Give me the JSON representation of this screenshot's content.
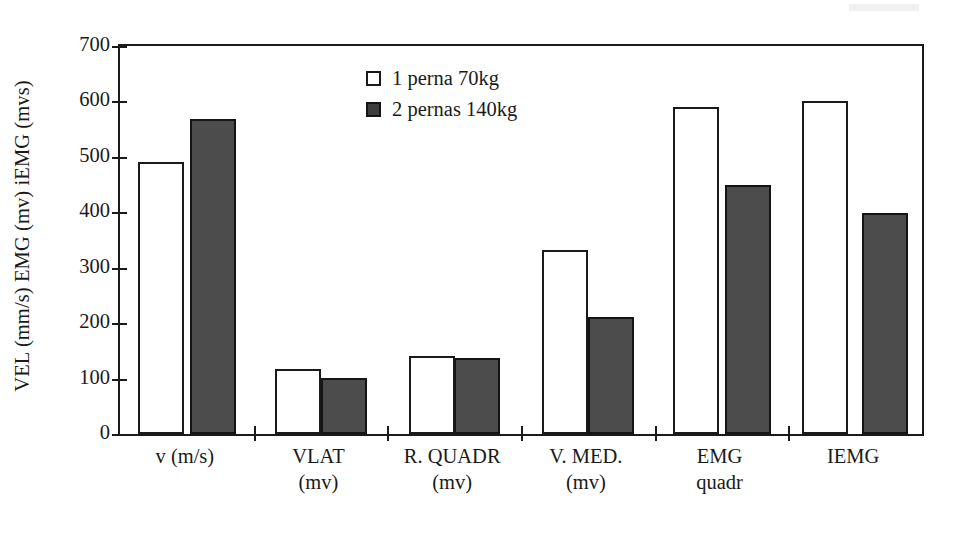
{
  "chart_data": {
    "type": "bar",
    "title": "",
    "subtitle": "",
    "xlabel": "",
    "ylabel": "VEL (mm/s)  EMG (mv)  iEMG (mvs)",
    "ylim": [
      0,
      700
    ],
    "yticks": [
      0,
      100,
      200,
      300,
      400,
      500,
      600,
      700
    ],
    "ytick_labels": [
      "0",
      "100",
      "200",
      "300",
      "400",
      "500",
      "600",
      "700"
    ],
    "grid": false,
    "legend_position": "upper-center",
    "categories": [
      "v (m/s)",
      "VLAT (mv)",
      "R. QUADR (mv)",
      "V. MED. (mv)",
      "EMG quadr",
      "IEMG"
    ],
    "category_lines": [
      {
        "line1": "v (m/s)",
        "line2": ""
      },
      {
        "line1": "VLAT",
        "line2": "(mv)"
      },
      {
        "line1": "R. QUADR",
        "line2": "(mv)"
      },
      {
        "line1": "V. MED.",
        "line2": "(mv)"
      },
      {
        "line1": "EMG",
        "line2": "quadr"
      },
      {
        "line1": "IEMG",
        "line2": ""
      }
    ],
    "series": [
      {
        "name": "1 perna 70kg",
        "color": "#ffffff",
        "edge_color": "#1a1a1a",
        "values": [
          490,
          117,
          141,
          332,
          590,
          601
        ]
      },
      {
        "name": "2 pernas 140kg",
        "color": "#4c4c4c",
        "edge_color": "#141414",
        "values": [
          568,
          101,
          137,
          211,
          450,
          398
        ]
      }
    ]
  },
  "legend": {
    "items": [
      {
        "label": "1 perna 70kg",
        "swatch": "light"
      },
      {
        "label": "2 pernas 140kg",
        "swatch": "dark"
      }
    ]
  },
  "axes": {
    "y_title": "VEL (mm/s)  EMG (mv)  iEMG (mvs)",
    "y_tick_labels": [
      "700",
      "600",
      "500",
      "400",
      "300",
      "200",
      "100",
      "0"
    ]
  },
  "colors": {
    "series_1_fill": "#ffffff",
    "series_2_fill": "#4c4c4c",
    "axis": "#1a1a1a",
    "background": "#ffffff"
  }
}
